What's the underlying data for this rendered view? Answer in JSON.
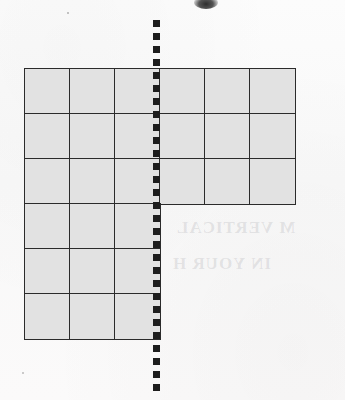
{
  "page": {
    "width": 345,
    "height": 400,
    "background_color": "#fbfbfb",
    "paper_note": "scanned worksheet page with faint show-through text"
  },
  "figure": {
    "name": "l-shaped-grid-figure",
    "shape_description": "L-shaped (hexomino-style) region made of unit squares",
    "cell_size_px": 45,
    "origin_px": {
      "x": 24,
      "y": 68
    },
    "fill_color": "#e2e2e2",
    "line_color": "#2b2b2b",
    "line_width_px": 1.6,
    "columns": 6,
    "rows": 6,
    "total_cells": 27,
    "row_widths_in_cells": [
      6,
      6,
      6,
      3,
      3,
      3
    ],
    "cells": [
      {
        "row": 1,
        "col": 1
      },
      {
        "row": 1,
        "col": 2
      },
      {
        "row": 1,
        "col": 3
      },
      {
        "row": 1,
        "col": 4
      },
      {
        "row": 1,
        "col": 5
      },
      {
        "row": 1,
        "col": 6
      },
      {
        "row": 2,
        "col": 1
      },
      {
        "row": 2,
        "col": 2
      },
      {
        "row": 2,
        "col": 3
      },
      {
        "row": 2,
        "col": 4
      },
      {
        "row": 2,
        "col": 5
      },
      {
        "row": 2,
        "col": 6
      },
      {
        "row": 3,
        "col": 1
      },
      {
        "row": 3,
        "col": 2
      },
      {
        "row": 3,
        "col": 3
      },
      {
        "row": 3,
        "col": 4
      },
      {
        "row": 3,
        "col": 5
      },
      {
        "row": 3,
        "col": 6
      },
      {
        "row": 4,
        "col": 1
      },
      {
        "row": 4,
        "col": 2
      },
      {
        "row": 4,
        "col": 3
      },
      {
        "row": 5,
        "col": 1
      },
      {
        "row": 5,
        "col": 2
      },
      {
        "row": 5,
        "col": 3
      },
      {
        "row": 6,
        "col": 1
      },
      {
        "row": 6,
        "col": 2
      },
      {
        "row": 6,
        "col": 3
      }
    ]
  },
  "symmetry_line": {
    "name": "vertical-dashed-line",
    "orientation": "vertical",
    "x_px": 157,
    "y_start_px": 20,
    "y_end_px": 392,
    "color": "#1d1d1d",
    "stroke_width_px": 7,
    "dash_px": 7,
    "gap_px": 6
  },
  "artifacts": {
    "ink_smudge": {
      "x": 194,
      "y": -4,
      "width": 24,
      "height": 13
    },
    "bleed_through_lines": [
      "M VERTICAL",
      "IN YOUR H"
    ]
  }
}
